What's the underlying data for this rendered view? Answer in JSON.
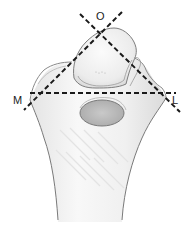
{
  "figure": {
    "labels": {
      "top": "O",
      "left": "M",
      "right": "L"
    },
    "colors": {
      "background": "#ffffff",
      "bone_fill": "#f2f2f2",
      "bone_shade": "#d9d9d9",
      "outline": "#6e6e6e",
      "dashed_line": "#1a1a1a",
      "label": "#222222"
    },
    "lines": [
      {
        "name": "horizontal-axis",
        "from": [
          30,
          93
        ],
        "to": [
          176,
          93
        ],
        "style": "dashed"
      },
      {
        "name": "oblique-axis-descending",
        "from": [
          80,
          14
        ],
        "to": [
          180,
          112
        ],
        "style": "dashed"
      },
      {
        "name": "oblique-axis-ascending",
        "from": [
          122,
          12
        ],
        "to": [
          24,
          110
        ],
        "style": "dashed"
      }
    ]
  }
}
